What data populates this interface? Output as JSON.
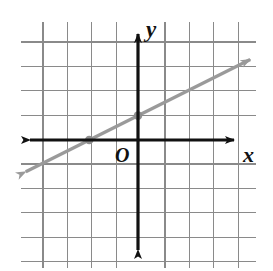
{
  "figure": {
    "kind": "coordinate-plane-line-graph",
    "background_color": "#ffffff",
    "width": 273,
    "height": 271
  },
  "labels": {
    "y_axis": "y",
    "x_axis": "x",
    "origin": "O"
  },
  "colors": {
    "grid": "#8a8a8a",
    "axis": "#111111",
    "line": "#9a9a9a",
    "point": "#8f8f8f",
    "background": "#ffffff"
  },
  "grid": {
    "spacing_px": 24.4,
    "vertical_lines_x": [
      43,
      67.4,
      91.8,
      116.2,
      140.6,
      165,
      189.4,
      213.8,
      238.2
    ],
    "horizontal_lines_y": [
      42,
      66.4,
      90.8,
      115.2,
      139.6,
      164,
      188.4,
      212.8,
      237.2,
      261.6
    ],
    "horizontal_extent_px": [
      21,
      256
    ],
    "vertical_extent_px": [
      22,
      268
    ]
  },
  "axes": {
    "origin_px": {
      "x": 138,
      "y": 140
    },
    "x_axis": {
      "start_px": 22,
      "end_px": 242,
      "y_px": 140,
      "arrows": [
        "left",
        "right"
      ]
    },
    "y_axis": {
      "start_px": 26,
      "end_px": 258,
      "x_px": 138,
      "arrows": [
        "up",
        "down"
      ]
    }
  },
  "chart_data": {
    "type": "line",
    "title": "",
    "xlabel": "x",
    "ylabel": "y",
    "grid": true,
    "legend": false,
    "xlim": [
      -4,
      4
    ],
    "ylim": [
      -4,
      5
    ],
    "series": [
      {
        "name": "line",
        "equation": "y = 0.5x + 1",
        "slope": 0.5,
        "y_intercept": 1,
        "x_intercept": -2,
        "color": "#9a9a9a",
        "arrow_both_ends": true,
        "x": [
          -4.6,
          4.6
        ],
        "values": [
          -1.3,
          3.3
        ],
        "points_marked": [
          {
            "x": -2,
            "y": 0,
            "label": "x-intercept"
          },
          {
            "x": 0,
            "y": 1,
            "label": "y-intercept"
          }
        ]
      }
    ]
  }
}
